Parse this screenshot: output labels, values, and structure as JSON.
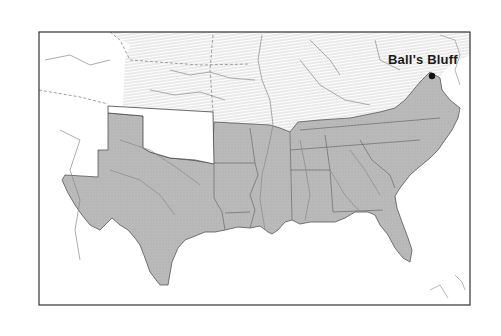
{
  "map": {
    "type": "historical-locator-map",
    "region": "Southeastern United States (Civil War era)",
    "shading": {
      "confederate_fill": "#b9b9b9",
      "union_hatch": "#d6d6d6",
      "territory_fill": "#ffffff",
      "border_color": "#333333"
    },
    "marker": {
      "label": "Ball's Bluff",
      "icon": "location-dot-icon"
    }
  }
}
